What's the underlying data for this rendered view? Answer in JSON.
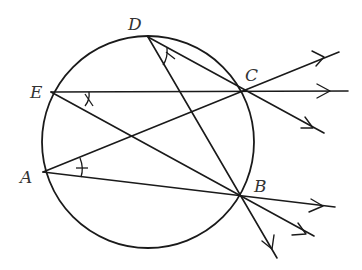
{
  "diagram": {
    "circle": {
      "cx": 148,
      "cy": 142,
      "r": 106
    },
    "points": [
      {
        "name": "D",
        "label": "D",
        "x": 148,
        "y": 37,
        "label_x": 128,
        "label_y": 30
      },
      {
        "name": "E",
        "label": "E",
        "x": 51,
        "y": 92,
        "label_x": 30,
        "label_y": 98
      },
      {
        "name": "C",
        "label": "C",
        "x": 244,
        "y": 91,
        "label_x": 245,
        "label_y": 82
      },
      {
        "name": "A",
        "label": "A",
        "x": 43,
        "y": 172,
        "label_x": 20,
        "label_y": 183
      },
      {
        "name": "B",
        "label": "B",
        "x": 241,
        "y": 196,
        "label_x": 254,
        "label_y": 192
      }
    ],
    "segments": [
      {
        "name": "ray-E-through-C",
        "from": "E",
        "to_xy": [
          348,
          91
        ],
        "arrow_at": [
          328,
          91
        ]
      },
      {
        "name": "ray-A-through-C",
        "from": "A",
        "to_xy": [
          339,
          52
        ],
        "arrow_at": [
          325,
          58
        ]
      },
      {
        "name": "ray-D-through-C",
        "from": "D",
        "to_xy": [
          324,
          133
        ],
        "arrow_at": [
          312,
          127
        ]
      },
      {
        "name": "ray-A-through-B",
        "from": "A",
        "to_xy": [
          335,
          207
        ],
        "arrow_at": [
          322,
          206
        ]
      },
      {
        "name": "ray-E-through-B",
        "from": "E",
        "to_xy": [
          314,
          236
        ],
        "arrow_at": [
          305,
          231
        ]
      },
      {
        "name": "ray-D-through-B",
        "from": "D",
        "to_xy": [
          277,
          258
        ],
        "arrow_at": [
          272,
          249
        ]
      }
    ],
    "angle_marks": [
      {
        "vertex": "D",
        "between": [
          "C",
          "B"
        ]
      },
      {
        "vertex": "E",
        "between": [
          "C",
          "B"
        ]
      },
      {
        "vertex": "A",
        "between": [
          "C",
          "B"
        ]
      }
    ]
  }
}
